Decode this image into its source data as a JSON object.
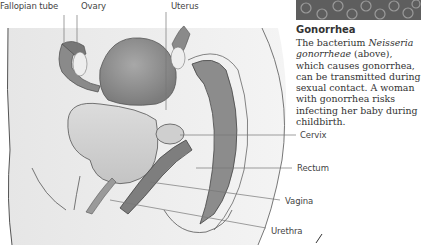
{
  "figure": {
    "labels": {
      "fallopian_tube": "Fallopian tube",
      "ovary": "Ovary",
      "uterus": "Uterus",
      "cervix": "Cervix",
      "rectum": "Rectum",
      "vagina": "Vagina",
      "urethra": "Urethra"
    }
  },
  "sidebar": {
    "photo_icon": "micrograph-image",
    "title": "Gonorrhea",
    "body_pre": "The bacterium ",
    "body_italic": "Neisseria gonorrheae",
    "body_post": " (above), which causes gonorrhea, can be transmitted during sexual contact. A woman with gonorrhea risks infecting her baby during childbirth."
  },
  "colors": {
    "background": "#ffffff",
    "body_fill": "#eaeaea",
    "organ_dark": "#8a8a8a",
    "organ_mid": "#b5b5b5",
    "text": "#333333"
  }
}
